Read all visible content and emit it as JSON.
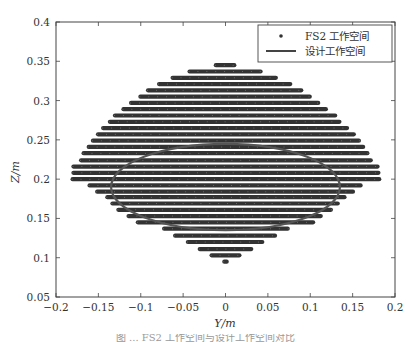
{
  "chart_data": {
    "type": "scatter",
    "title": "",
    "xlabel": "Y/m",
    "ylabel": "Z/m",
    "xlim": [
      -0.2,
      0.2
    ],
    "ylim": [
      0.05,
      0.4
    ],
    "xticks": [
      -0.2,
      -0.15,
      -0.1,
      -0.05,
      0,
      0.05,
      0.1,
      0.15,
      0.2
    ],
    "xtick_labels": [
      "−0.2",
      "−0.15",
      "−0.1",
      "−0.05",
      "0",
      "0.05",
      "0.1",
      "0.15",
      "0.2"
    ],
    "yticks": [
      0.05,
      0.1,
      0.15,
      0.2,
      0.25,
      0.3,
      0.35,
      0.4
    ],
    "ytick_labels": [
      "0.05",
      "0.1",
      "0.15",
      "0.2",
      "0.25",
      "0.3",
      "0.35",
      "0.4"
    ],
    "grid": false,
    "legend_position": "upper right",
    "legend": [
      {
        "label": "FS2 工作空间",
        "marker": "dot"
      },
      {
        "label": "设计工作空间",
        "marker": "line"
      }
    ],
    "series": [
      {
        "name": "FS2 工作空间",
        "type": "scatter",
        "color": "#333333",
        "point_step_y": 0.0035,
        "rows": [
          {
            "z": 0.345,
            "ymin": -0.012,
            "ymax": 0.011
          },
          {
            "z": 0.337,
            "ymin": -0.043,
            "ymax": 0.042
          },
          {
            "z": 0.329,
            "ymin": -0.063,
            "ymax": 0.06
          },
          {
            "z": 0.321,
            "ymin": -0.079,
            "ymax": 0.077
          },
          {
            "z": 0.313,
            "ymin": -0.092,
            "ymax": 0.09
          },
          {
            "z": 0.305,
            "ymin": -0.101,
            "ymax": 0.1
          },
          {
            "z": 0.297,
            "ymin": -0.112,
            "ymax": 0.11
          },
          {
            "z": 0.289,
            "ymin": -0.121,
            "ymax": 0.119
          },
          {
            "z": 0.281,
            "ymin": -0.131,
            "ymax": 0.13
          },
          {
            "z": 0.273,
            "ymin": -0.137,
            "ymax": 0.135
          },
          {
            "z": 0.265,
            "ymin": -0.145,
            "ymax": 0.144
          },
          {
            "z": 0.257,
            "ymin": -0.151,
            "ymax": 0.152
          },
          {
            "z": 0.249,
            "ymin": -0.157,
            "ymax": 0.158
          },
          {
            "z": 0.241,
            "ymin": -0.162,
            "ymax": 0.163
          },
          {
            "z": 0.233,
            "ymin": -0.168,
            "ymax": 0.168
          },
          {
            "z": 0.224,
            "ymin": -0.171,
            "ymax": 0.172
          },
          {
            "z": 0.216,
            "ymin": -0.18,
            "ymax": 0.18
          },
          {
            "z": 0.208,
            "ymin": -0.18,
            "ymax": 0.181
          },
          {
            "z": 0.2,
            "ymin": -0.181,
            "ymax": 0.182
          },
          {
            "z": 0.192,
            "ymin": -0.161,
            "ymax": 0.16
          },
          {
            "z": 0.184,
            "ymin": -0.152,
            "ymax": 0.151
          },
          {
            "z": 0.177,
            "ymin": -0.14,
            "ymax": 0.141
          },
          {
            "z": 0.169,
            "ymin": -0.134,
            "ymax": 0.133
          },
          {
            "z": 0.161,
            "ymin": -0.127,
            "ymax": 0.125
          },
          {
            "z": 0.153,
            "ymin": -0.115,
            "ymax": 0.113
          },
          {
            "z": 0.145,
            "ymin": -0.104,
            "ymax": 0.104
          },
          {
            "z": 0.137,
            "ymin": -0.073,
            "ymax": 0.074
          },
          {
            "z": 0.128,
            "ymin": -0.06,
            "ymax": 0.059
          },
          {
            "z": 0.12,
            "ymin": -0.045,
            "ymax": 0.044
          },
          {
            "z": 0.111,
            "ymin": -0.031,
            "ymax": 0.031
          },
          {
            "z": 0.103,
            "ymin": -0.017,
            "ymax": 0.017
          },
          {
            "z": 0.095,
            "ymin": -0.002,
            "ymax": 0.002
          }
        ]
      },
      {
        "name": "设计工作空间",
        "type": "ellipse",
        "color": "#555555",
        "center": [
          0,
          0.19
        ],
        "semi_axis_y": 0.135,
        "semi_axis_z": 0.055
      }
    ]
  },
  "caption": "图 ... FS2 工作空间与设计工作空间对比"
}
